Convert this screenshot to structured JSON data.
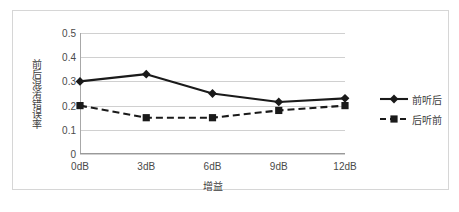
{
  "chart_data": {
    "type": "line",
    "title": "",
    "xlabel": "增益",
    "ylabel": "前后混淆错误率",
    "categories": [
      "0dB",
      "3dB",
      "6dB",
      "9dB",
      "12dB"
    ],
    "ylim": [
      0,
      0.5
    ],
    "yticks": [
      "0.5",
      "0.4",
      "0.3",
      "0.2",
      "0.1",
      "0"
    ],
    "ytick_values": [
      0.5,
      0.4,
      0.3,
      0.2,
      0.1,
      0
    ],
    "grid": "horizontal",
    "legend_position": "right",
    "series": [
      {
        "name": "前听后",
        "values": [
          0.3,
          0.33,
          0.25,
          0.215,
          0.23
        ],
        "line_style": "solid",
        "marker": "diamond",
        "color": "#1a1a1a"
      },
      {
        "name": "后听前",
        "values": [
          0.2,
          0.15,
          0.15,
          0.18,
          0.2
        ],
        "line_style": "dashed",
        "marker": "square",
        "color": "#1a1a1a"
      }
    ]
  }
}
